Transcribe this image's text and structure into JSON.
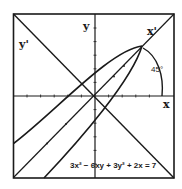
{
  "figure": {
    "type": "diagram",
    "labels": {
      "x_axis": "x",
      "y_axis": "y",
      "x_prime_axis": "x'",
      "y_prime_axis": "y'",
      "angle": "45°",
      "equation": "3x² − 6xy + 3y² + 2x = 7"
    },
    "colors": {
      "ink": "#1a1a1a",
      "background": "#ffffff"
    }
  }
}
